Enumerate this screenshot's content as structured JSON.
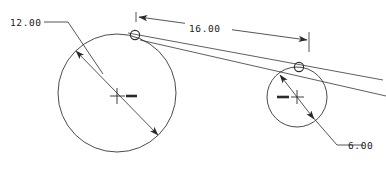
{
  "drawing": {
    "type": "cad-dimensioned-drawing",
    "background_color": "#ffffff",
    "line_color": "#2a2a2a",
    "text_color": "#1a1a1a",
    "entities": {
      "large_circle": {
        "name": "large-circle",
        "center_x": 117,
        "center_y": 93,
        "radius": 59,
        "diameter_label": "12.00"
      },
      "small_circle": {
        "name": "small-circle",
        "center_x": 297,
        "center_y": 97,
        "radius": 30,
        "diameter_label": "6.00"
      },
      "tangent_node_left": {
        "name": "tangent-node-left",
        "x": 135,
        "y": 35,
        "radius": 5
      },
      "tangent_node_right": {
        "name": "tangent-node-right",
        "x": 299,
        "y": 67,
        "radius": 5
      }
    },
    "dimensions": {
      "large_diameter": {
        "label": "12.00",
        "text_x": 10,
        "text_y": 26,
        "kind": "diameter-leader"
      },
      "center_distance": {
        "label": "16.00",
        "text_x": 189,
        "text_y": 32,
        "kind": "linear-aligned"
      },
      "small_diameter": {
        "label": "6.00",
        "text_x": 348,
        "text_y": 149,
        "kind": "diameter-leader"
      }
    }
  }
}
